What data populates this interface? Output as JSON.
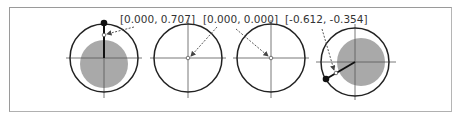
{
  "figure": {
    "panels": [
      {
        "label": "[0.000, 0.707]",
        "cx": 104,
        "cy": 58,
        "r": 34,
        "disk_r": 24,
        "disk_cx": 104,
        "disk_cy": 66,
        "has_disk": true,
        "point": {
          "x": 104,
          "y": 22
        },
        "marker": {
          "x": 104,
          "y": 33
        },
        "label_x": 120,
        "label_y": 23
      },
      {
        "label": "[0.000, 0.000]",
        "cx": 188,
        "cy": 58,
        "r": 34,
        "has_disk": false,
        "marker": {
          "x": 188,
          "y": 58
        },
        "label_x": 203,
        "label_y": 23
      },
      {
        "label": "[0.000, 0.000]",
        "cx": 271,
        "cy": 58,
        "r": 34,
        "has_disk": false,
        "marker": {
          "x": 271,
          "y": 58
        },
        "label_x": 0,
        "label_y": 0
      },
      {
        "label": "[-0.612, -0.354]",
        "cx": 355,
        "cy": 62,
        "r": 34,
        "disk_r": 24,
        "disk_cx": 362,
        "disk_cy": 62,
        "has_disk": true,
        "point": {
          "x": 325,
          "y": 79
        },
        "marker": {
          "x": 334,
          "y": 73
        },
        "label_x": 285,
        "label_y": 23
      }
    ],
    "colors": {
      "circle": "#222222",
      "axis": "#555555",
      "disk": "#a9a9a9",
      "arrow": "#444444",
      "text": "#333333"
    }
  }
}
